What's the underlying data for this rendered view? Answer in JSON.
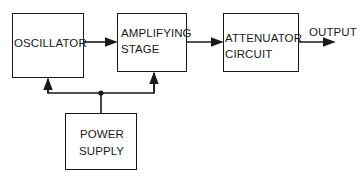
{
  "diagram": {
    "type": "block-diagram",
    "blocks": {
      "oscillator": {
        "line1": "OSCILLATOR"
      },
      "amplifier": {
        "line1": "AMPLIFYING",
        "line2": "STAGE"
      },
      "attenuator": {
        "line1": "ATTENUATOR",
        "line2": "CIRCUIT"
      },
      "power_supply": {
        "line1": "POWER",
        "line2": "SUPPLY"
      }
    },
    "output_label": "OUTPUT",
    "connections": [
      {
        "from": "oscillator",
        "to": "amplifier"
      },
      {
        "from": "amplifier",
        "to": "attenuator"
      },
      {
        "from": "attenuator",
        "to": "output"
      },
      {
        "from": "power_supply",
        "to": "oscillator"
      },
      {
        "from": "power_supply",
        "to": "amplifier"
      }
    ]
  }
}
